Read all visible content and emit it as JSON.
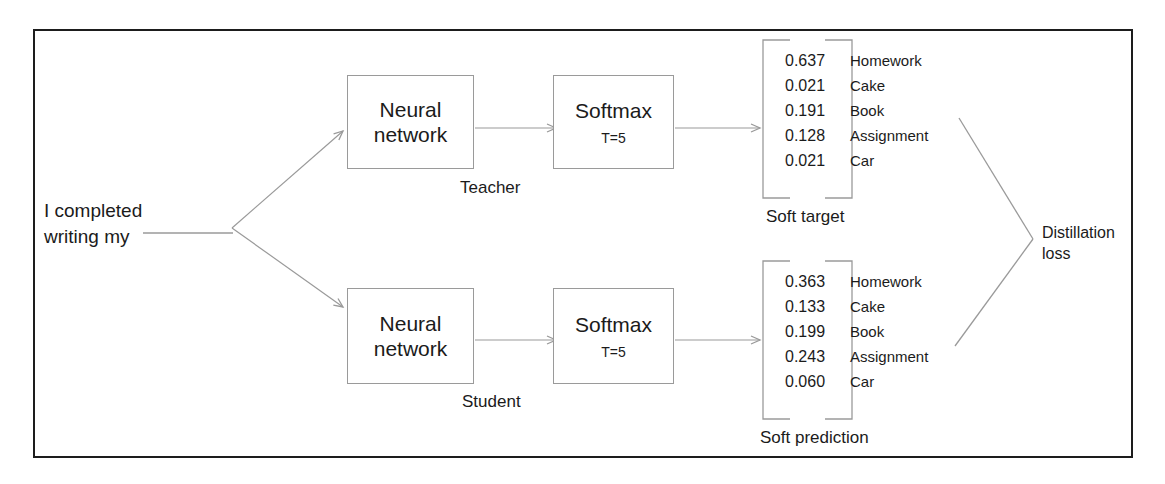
{
  "diagram": {
    "frame_color": "#1d1d1d",
    "line_color": "#9a9a9a",
    "text_color": "#1b1b1b",
    "background": "#ffffff"
  },
  "input": {
    "prompt_text": "I completed\nwriting my",
    "blank_label": "blank-underline"
  },
  "teacher": {
    "role_label": "Teacher",
    "network_box": {
      "title": "Neural\nnetwork"
    },
    "softmax_box": {
      "title": "Softmax",
      "temperature": "T=5"
    },
    "output": {
      "caption": "Soft target",
      "rows": [
        {
          "value": "0.637",
          "label": "Homework"
        },
        {
          "value": "0.021",
          "label": "Cake"
        },
        {
          "value": "0.191",
          "label": "Book"
        },
        {
          "value": "0.128",
          "label": "Assignment"
        },
        {
          "value": "0.021",
          "label": "Car"
        }
      ]
    }
  },
  "student": {
    "role_label": "Student",
    "network_box": {
      "title": "Neural\nnetwork"
    },
    "softmax_box": {
      "title": "Softmax",
      "temperature": "T=5"
    },
    "output": {
      "caption": "Soft prediction",
      "rows": [
        {
          "value": "0.363",
          "label": "Homework"
        },
        {
          "value": "0.133",
          "label": "Cake"
        },
        {
          "value": "0.199",
          "label": "Book"
        },
        {
          "value": "0.243",
          "label": "Assignment"
        },
        {
          "value": "0.060",
          "label": "Car"
        }
      ]
    }
  },
  "loss": {
    "label": "Distillation\nloss"
  }
}
